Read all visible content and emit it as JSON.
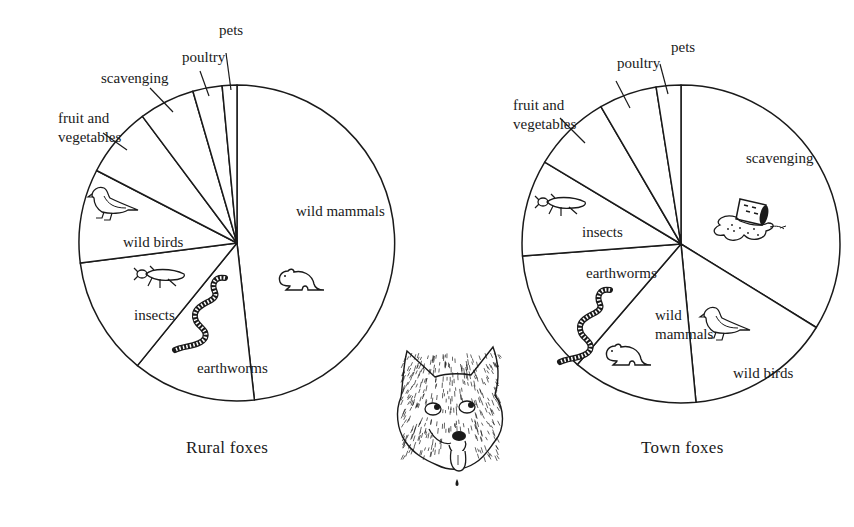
{
  "chart_data": [
    {
      "type": "pie",
      "title": "Rural foxes",
      "start_angle_deg": 0,
      "direction": "clockwise",
      "categories": [
        "wild mammals",
        "earthworms",
        "insects",
        "wild birds",
        "fruit and vegetables",
        "scavenging",
        "poultry",
        "pets"
      ],
      "values": [
        48.2,
        12.6,
        12.1,
        9.6,
        7.2,
        5.7,
        3.0,
        1.5
      ],
      "unit": "% of diet (estimated from slice angles)",
      "center": [
        237,
        243
      ],
      "radius": 158,
      "labels": [
        {
          "text": [
            "wild mammals"
          ],
          "x": 296,
          "y": 216,
          "inside": true
        },
        {
          "text": [
            "earthworms"
          ],
          "x": 197,
          "y": 373,
          "inside": true
        },
        {
          "text": [
            "insects"
          ],
          "x": 134,
          "y": 320,
          "inside": true
        },
        {
          "text": [
            "wild birds"
          ],
          "x": 123,
          "y": 247,
          "inside": true
        },
        {
          "text": [
            "fruit and",
            "vegetables"
          ],
          "x": 58,
          "y": 123,
          "inside": false,
          "leader": [
            [
              103,
              133
            ],
            [
              127,
              150
            ]
          ]
        },
        {
          "text": [
            "scavenging"
          ],
          "x": 101,
          "y": 83,
          "inside": false,
          "leader": [
            [
              150,
              88
            ],
            [
              173,
              112
            ]
          ]
        },
        {
          "text": [
            "poultry"
          ],
          "x": 182,
          "y": 62,
          "inside": false,
          "leader": [
            [
              200,
              71
            ],
            [
              209,
              96
            ]
          ]
        },
        {
          "text": [
            "pets"
          ],
          "x": 219,
          "y": 35,
          "inside": false,
          "leader": [
            [
              226,
              53
            ],
            [
              231,
              90
            ]
          ]
        }
      ],
      "icons": [
        {
          "name": "mouse-icon",
          "slice": "wild mammals",
          "x": 278,
          "y": 268
        },
        {
          "name": "earthworm-icon",
          "slice": "earthworms",
          "x": 175,
          "y": 278
        },
        {
          "name": "beetle-icon",
          "slice": "insects",
          "x": 132,
          "y": 266
        },
        {
          "name": "bird-icon",
          "slice": "wild birds",
          "x": 88,
          "y": 186
        }
      ]
    },
    {
      "type": "pie",
      "title": "Town foxes",
      "start_angle_deg": 0,
      "direction": "clockwise",
      "categories": [
        "scavenging",
        "wild birds",
        "wild mammals",
        "earthworms",
        "insects",
        "fruit and vegetables",
        "poultry",
        "pets"
      ],
      "values": [
        33.8,
        14.7,
        12.8,
        12.5,
        9.8,
        8.0,
        5.9,
        2.5
      ],
      "unit": "% of diet (estimated from slice angles)",
      "center": [
        681,
        244
      ],
      "radius": 159,
      "labels": [
        {
          "text": [
            "scavenging"
          ],
          "x": 746,
          "y": 163,
          "inside": true
        },
        {
          "text": [
            "wild birds"
          ],
          "x": 733,
          "y": 378,
          "inside": true
        },
        {
          "text": [
            "wild",
            "mammals"
          ],
          "x": 655,
          "y": 320,
          "inside": true
        },
        {
          "text": [
            "earthworms"
          ],
          "x": 586,
          "y": 278,
          "inside": true
        },
        {
          "text": [
            "insects"
          ],
          "x": 582,
          "y": 237,
          "inside": true
        },
        {
          "text": [
            "fruit and",
            "vegetables"
          ],
          "x": 513,
          "y": 110,
          "inside": false,
          "leader": [
            [
              560,
              118
            ],
            [
              585,
              143
            ]
          ]
        },
        {
          "text": [
            "poultry"
          ],
          "x": 617,
          "y": 68,
          "inside": false,
          "leader": [
            [
              616,
              81
            ],
            [
              630,
              108
            ]
          ]
        },
        {
          "text": [
            "pets"
          ],
          "x": 671,
          "y": 52,
          "inside": false,
          "leader": [
            [
              660,
              64
            ],
            [
              668,
              94
            ]
          ]
        }
      ],
      "icons": [
        {
          "name": "spilled-trash-can-icon",
          "slice": "scavenging",
          "x": 710,
          "y": 195
        },
        {
          "name": "bird-icon",
          "slice": "wild birds",
          "x": 700,
          "y": 306
        },
        {
          "name": "mouse-icon",
          "slice": "wild mammals",
          "x": 605,
          "y": 343
        },
        {
          "name": "earthworm-icon",
          "slice": "earthworms",
          "x": 560,
          "y": 290
        },
        {
          "name": "beetle-icon",
          "slice": "insects",
          "x": 533,
          "y": 194
        }
      ]
    }
  ],
  "captions": {
    "rural": "Rural foxes",
    "town": "Town foxes"
  },
  "decoration": {
    "center_illustration": "fox-head-icon",
    "center": [
      449,
      412
    ]
  },
  "colors": {
    "ink": "#1a1a1a",
    "paper": "#ffffff"
  }
}
